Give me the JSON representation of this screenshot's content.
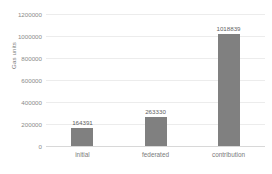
{
  "chart_data": {
    "type": "bar",
    "title": "",
    "xlabel": "",
    "ylabel": "Gas units",
    "categories": [
      "initial",
      "federated",
      "contribution"
    ],
    "values": [
      164391,
      263330,
      1018839
    ],
    "value_labels": [
      "164391",
      "263330",
      "1018839"
    ],
    "ylim": [
      0,
      1200000
    ],
    "ytick_values": [
      0,
      200000,
      400000,
      600000,
      800000,
      1000000,
      1200000
    ],
    "ytick_labels": [
      "0",
      "200000",
      "400000",
      "600000",
      "800000",
      "1000000",
      "1200000"
    ],
    "grid": "horizontal",
    "legend": "none",
    "series": [
      {
        "name": "Gas units",
        "values": [
          164391,
          263330,
          1018839
        ]
      }
    ],
    "colors": {
      "bar": "#808080",
      "gridline": "#ececec",
      "axis_line": "#d8d8d8",
      "tick_text": "#8a8a8a",
      "value_text": "#5f5f5f",
      "category_text": "#7b7b7b",
      "background": "#ffffff"
    }
  }
}
